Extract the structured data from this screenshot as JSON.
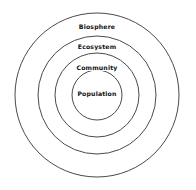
{
  "canvas": {
    "width": 196,
    "height": 190,
    "background_color": "#ffffff"
  },
  "diagram": {
    "type": "concentric-circles",
    "stroke_color": "#4a4a4a",
    "label_color": "#111111",
    "center": {
      "x": 97,
      "y": 95
    },
    "rings": [
      {
        "label": "Biosphere",
        "level": 1,
        "radius": 82,
        "label_x": 97,
        "label_y": 27
      },
      {
        "label": "Ecosystem",
        "level": 2,
        "radius": 59,
        "label_x": 97,
        "label_y": 47
      },
      {
        "label": "Community",
        "level": 3,
        "radius": 42,
        "label_x": 97,
        "label_y": 68
      },
      {
        "label": "Population",
        "level": 4,
        "radius": 25,
        "label_x": 97,
        "label_y": 94
      }
    ]
  },
  "chart_data": {
    "type": "pie",
    "subtitle": "",
    "xlabel": "",
    "ylabel": "",
    "categories": [
      "Biosphere",
      "Ecosystem",
      "Community",
      "Population"
    ],
    "values": [
      82,
      59,
      42,
      25
    ],
    "series": [
      {
        "name": "Nesting radius (px)",
        "values": [
          82,
          59,
          42,
          25
        ]
      }
    ],
    "annotations": [
      "Biosphere",
      "Ecosystem",
      "Community",
      "Population"
    ],
    "legend_position": "none",
    "grid": false
  }
}
